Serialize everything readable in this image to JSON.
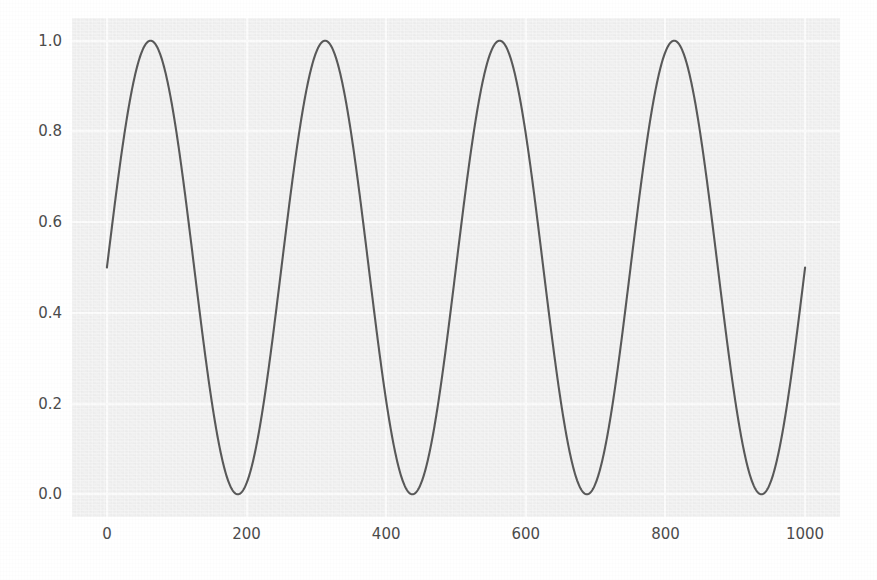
{
  "chart_data": {
    "type": "line",
    "title": "",
    "xlabel": "",
    "ylabel": "",
    "xlim": [
      -50,
      1050
    ],
    "ylim": [
      -0.05,
      1.05
    ],
    "grid": true,
    "legend": null,
    "xticks": [
      "0",
      "200",
      "400",
      "600",
      "800",
      "1000"
    ],
    "xtick_values": [
      0,
      200,
      400,
      600,
      800,
      1000
    ],
    "yticks": [
      "0.0",
      "0.2",
      "0.4",
      "0.6",
      "0.8",
      "1.0"
    ],
    "ytick_values": [
      0.0,
      0.2,
      0.4,
      0.6,
      0.8,
      1.0
    ],
    "line_color": "#595959",
    "line_width": 2.1,
    "plot_background": "#f0f0f0",
    "figure_background": "#ffffff",
    "gridline_color": "#fbfbfb",
    "tick_label_color": "#4c4c4c",
    "series": [
      {
        "name": "sine",
        "formula": "y = 0.5 + 0.5*sin(2*pi*x/250)",
        "amplitude": 0.5,
        "offset": 0.5,
        "period": 250,
        "phase": 0,
        "cycles": 4,
        "x_start": 0,
        "x_end": 1000,
        "y_start": 0.5,
        "y_end": 0.5,
        "peaks_x": [
          62.5,
          312.5,
          562.5,
          812.5
        ],
        "peaks_y": [
          1.0,
          1.0,
          1.0,
          1.0
        ],
        "troughs_x": [
          187.5,
          437.5,
          687.5,
          937.5
        ],
        "troughs_y": [
          0.0,
          0.0,
          0.0,
          0.0
        ],
        "x": [
          0,
          25,
          50,
          75,
          100,
          125,
          150,
          175,
          200,
          225,
          250,
          275,
          300,
          325,
          350,
          375,
          400,
          425,
          450,
          475,
          500,
          525,
          550,
          575,
          600,
          625,
          650,
          675,
          700,
          725,
          750,
          775,
          800,
          825,
          850,
          875,
          900,
          925,
          950,
          975,
          1000
        ],
        "y": [
          0.5,
          0.794,
          0.976,
          0.976,
          0.794,
          0.5,
          0.206,
          0.024,
          0.024,
          0.206,
          0.5,
          0.794,
          0.976,
          0.976,
          0.794,
          0.5,
          0.206,
          0.024,
          0.024,
          0.206,
          0.5,
          0.794,
          0.976,
          0.976,
          0.794,
          0.5,
          0.206,
          0.024,
          0.024,
          0.206,
          0.5,
          0.794,
          0.976,
          0.976,
          0.794,
          0.5,
          0.206,
          0.024,
          0.024,
          0.206,
          0.5
        ]
      }
    ]
  }
}
